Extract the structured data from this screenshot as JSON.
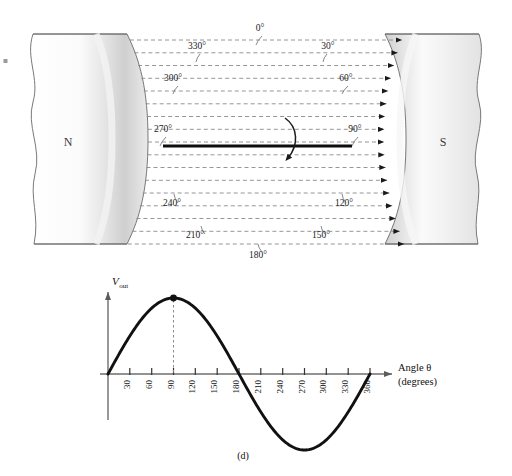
{
  "figure": {
    "caption": "(d)",
    "poles": {
      "north_label": "N",
      "south_label": "S"
    },
    "field": {
      "description": "magnetic-field-lines",
      "line_count": 17,
      "direction": "left-to-right",
      "style": "dashed-with-arrowheads"
    },
    "rotor": {
      "description": "rotating-coil-bar",
      "rotation_arrow": "clockwise"
    },
    "angle_labels": [
      {
        "text": "0°",
        "x": 260,
        "y": 31,
        "lx": 262,
        "ly": 36,
        "ex": 256,
        "ey": 45
      },
      {
        "text": "330°",
        "x": 197,
        "y": 49,
        "lx": 200,
        "ly": 54,
        "ex": 196,
        "ey": 62
      },
      {
        "text": "30°",
        "x": 328,
        "y": 49,
        "lx": 327,
        "ly": 54,
        "ex": 323,
        "ey": 62
      },
      {
        "text": "300°",
        "x": 173,
        "y": 81,
        "lx": 178,
        "ly": 86,
        "ex": 173,
        "ey": 94
      },
      {
        "text": "60°",
        "x": 346,
        "y": 81,
        "lx": 348,
        "ly": 86,
        "ex": 342,
        "ey": 94
      },
      {
        "text": "270°",
        "x": 163,
        "y": 132,
        "lx": 166,
        "ly": 137,
        "ex": 160,
        "ey": 146
      },
      {
        "text": "90°",
        "x": 355,
        "y": 132,
        "lx": 358,
        "ly": 137,
        "ex": 352,
        "ey": 146
      },
      {
        "text": "240°",
        "x": 172,
        "y": 206,
        "lx": 178,
        "ly": 203,
        "ex": 174,
        "ey": 194
      },
      {
        "text": "120°",
        "x": 344,
        "y": 206,
        "lx": 346,
        "ly": 203,
        "ex": 342,
        "ey": 194
      },
      {
        "text": "210°",
        "x": 195,
        "y": 238,
        "lx": 205,
        "ly": 234,
        "ex": 201,
        "ey": 226
      },
      {
        "text": "150°",
        "x": 321,
        "y": 238,
        "lx": 325,
        "ly": 234,
        "ex": 321,
        "ey": 226
      },
      {
        "text": "180°",
        "x": 258,
        "y": 258,
        "lx": 262,
        "ly": 252,
        "ex": 258,
        "ey": 244
      }
    ]
  },
  "chart_data": {
    "type": "line",
    "title": "",
    "subtitle": "",
    "xlabel": "Angle θ (degrees)",
    "xlabel_line1": "Angle θ",
    "xlabel_line2": "(degrees)",
    "ylabel": "Vout",
    "ylabel_main": "V",
    "ylabel_sub": "out",
    "xlim": [
      0,
      360
    ],
    "ylim": [
      -1,
      1
    ],
    "grid": false,
    "legend": null,
    "function": "sine",
    "tick_labels": [
      "30",
      "60",
      "90",
      "120",
      "150",
      "180",
      "210",
      "240",
      "270",
      "300",
      "330",
      "360"
    ],
    "tick_values": [
      30,
      60,
      90,
      120,
      150,
      180,
      210,
      240,
      270,
      300,
      330,
      360
    ],
    "x": [
      0,
      15,
      30,
      45,
      60,
      75,
      90,
      105,
      120,
      135,
      150,
      165,
      180,
      195,
      210,
      225,
      240,
      255,
      270,
      285,
      300,
      315,
      330,
      345,
      360
    ],
    "values": [
      0,
      0.259,
      0.5,
      0.707,
      0.866,
      0.966,
      1.0,
      0.966,
      0.866,
      0.707,
      0.5,
      0.259,
      0.0,
      -0.259,
      -0.5,
      -0.707,
      -0.866,
      -0.966,
      -1.0,
      -0.966,
      -0.866,
      -0.707,
      -0.5,
      -0.259,
      0.0
    ],
    "annotations": [
      {
        "name": "peak-marker",
        "x": 90,
        "y": 1.0,
        "label": "",
        "marker": "filled-dot",
        "guide": "dashed-vertical"
      }
    ]
  },
  "colors": {
    "curve": "#111111",
    "axis": "#6e6e6e",
    "field_line": "#8a8a8a",
    "rotor": "#0d0d0d",
    "magnet_outline": "#6a6a6a",
    "magnet_shade": "#c9c9c9",
    "text": "#111111"
  }
}
